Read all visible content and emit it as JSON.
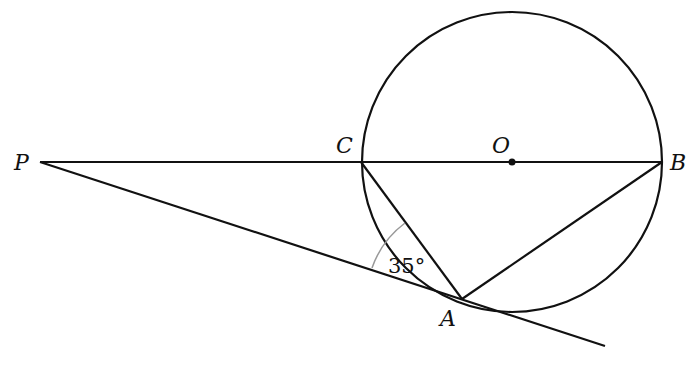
{
  "diagram": {
    "type": "geometry",
    "colors": {
      "stroke": "#111111",
      "angle_arc": "#999999",
      "background": "#ffffff"
    },
    "points": {
      "P": {
        "label": "P",
        "x": 40,
        "y": 162
      },
      "C": {
        "label": "C",
        "x": 361,
        "y": 162
      },
      "O": {
        "label": "O",
        "x": 512,
        "y": 162
      },
      "B": {
        "label": "B",
        "x": 662,
        "y": 162
      },
      "A": {
        "label": "A",
        "x": 462,
        "y": 299
      }
    },
    "circle": {
      "center": "O",
      "radius": 150
    },
    "segments": [
      {
        "from": "P",
        "to": "B",
        "name": "secant-line-pb"
      },
      {
        "from": "P",
        "to": "A",
        "name": "tangent-line-pa",
        "extends_to": {
          "x": 605,
          "y": 346
        }
      },
      {
        "from": "C",
        "to": "A",
        "name": "chord-ca"
      },
      {
        "from": "A",
        "to": "B",
        "name": "chord-ab"
      }
    ],
    "angle_marker": {
      "label": "35°",
      "vertex": "A",
      "between": [
        "P",
        "C"
      ]
    }
  }
}
